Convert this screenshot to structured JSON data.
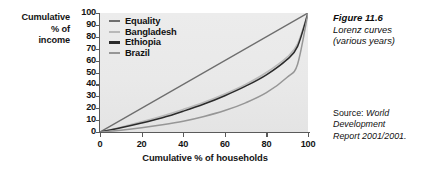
{
  "figure": {
    "caption_title": "Figure 11.6",
    "caption_sub_line1": "Lorenz curves",
    "caption_sub_line2": "(various years)",
    "source_lead": "Source: ",
    "source_line1": "World",
    "source_line2": "Development",
    "source_line3": "Report 2001/2001."
  },
  "axis_title": {
    "y_line1": "Cumulative",
    "y_line2": "% of",
    "y_line3": "income",
    "x": "Cumulative % of households"
  },
  "legend": {
    "items": [
      {
        "label": "Equality",
        "color": "#6e6e6e"
      },
      {
        "label": "Bangladesh",
        "color": "#b9b9b9"
      },
      {
        "label": "Ethiopia",
        "color": "#2b2b2b"
      },
      {
        "label": "Brazil",
        "color": "#969696"
      }
    ]
  },
  "chart_data": {
    "type": "line",
    "title": "Lorenz curves (various years)",
    "xlabel": "Cumulative % of households",
    "ylabel": "Cumulative % of income",
    "xlim": [
      0,
      100
    ],
    "ylim": [
      0,
      100
    ],
    "xticks": [
      0,
      20,
      40,
      60,
      80,
      100
    ],
    "yticks": [
      0,
      10,
      20,
      30,
      40,
      50,
      60,
      70,
      80,
      90,
      100
    ],
    "grid": false,
    "legend_position": "top-left inside plot",
    "plot_background": "#e9e9e9",
    "x": [
      0,
      10,
      20,
      30,
      40,
      50,
      60,
      70,
      80,
      90,
      95,
      100
    ],
    "series": [
      {
        "name": "Equality",
        "color": "#6e6e6e",
        "width": 1.5,
        "values": [
          0,
          10,
          20,
          30,
          40,
          50,
          60,
          70,
          80,
          90,
          95,
          100
        ]
      },
      {
        "name": "Bangladesh",
        "color": "#b9b9b9",
        "width": 1.6,
        "values": [
          0,
          4,
          8.5,
          13.5,
          19,
          25,
          32,
          40,
          50,
          63,
          74,
          100
        ]
      },
      {
        "name": "Ethiopia",
        "color": "#2b2b2b",
        "width": 1.5,
        "values": [
          0,
          3.5,
          7.5,
          12,
          17.5,
          23.5,
          30.5,
          38.5,
          48,
          61,
          72,
          100
        ]
      },
      {
        "name": "Brazil",
        "color": "#969696",
        "width": 1.5,
        "values": [
          0,
          1.5,
          3.5,
          6,
          9,
          13,
          18,
          24.5,
          33,
          46,
          57,
          100
        ]
      }
    ]
  }
}
